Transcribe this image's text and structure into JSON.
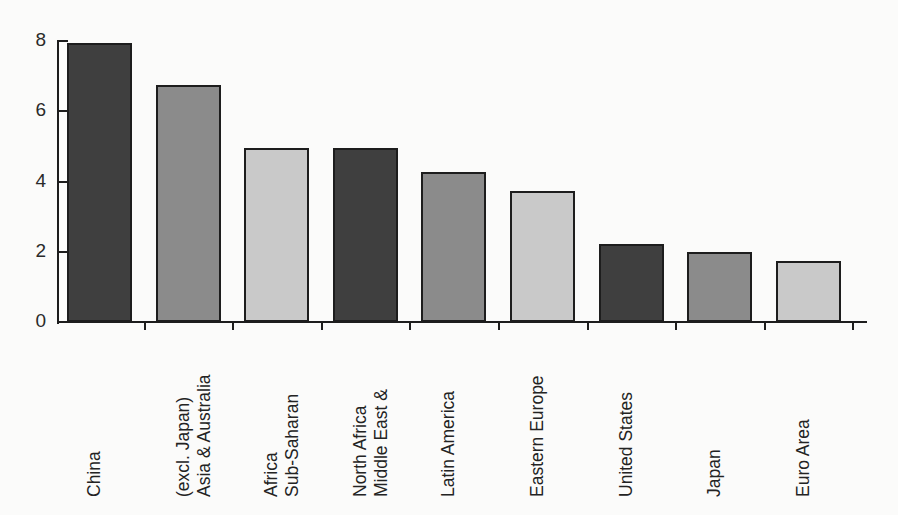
{
  "chart_data": {
    "type": "bar",
    "title": "",
    "subtitle": "",
    "xlabel": "",
    "ylabel": "",
    "ylim": [
      0,
      8
    ],
    "y_ticks": [
      0,
      2,
      4,
      6,
      8
    ],
    "y_tick_labels": [
      "0",
      "2",
      "4",
      "6",
      "8"
    ],
    "grid": false,
    "legend": false,
    "orientation": "vertical",
    "categories": [
      "China",
      "Asia & Australia\n(excl. Japan)",
      "Sub-Saharan\nAfrica",
      "Middle East &\nNorth Africa",
      "Latin America",
      "Eastern Europe",
      "United States",
      "Japan",
      "Euro Area"
    ],
    "bars": [
      {
        "label": "China",
        "label_lines": [
          "China"
        ],
        "value": 7.95,
        "fill": "#3f3f3f"
      },
      {
        "label": "Asia & Australia (excl. Japan)",
        "label_lines": [
          "(excl. Japan)",
          "Asia & Australia"
        ],
        "value": 6.75,
        "fill": "#8b8b8b"
      },
      {
        "label": "Sub-Saharan Africa",
        "label_lines": [
          "Africa",
          "Sub-Saharan"
        ],
        "value": 4.97,
        "fill": "#c9c9c9"
      },
      {
        "label": "Middle East & North Africa",
        "label_lines": [
          "North Africa",
          "Middle East &"
        ],
        "value": 4.97,
        "fill": "#3f3f3f"
      },
      {
        "label": "Latin America",
        "label_lines": [
          "Latin America"
        ],
        "value": 4.26,
        "fill": "#8b8b8b"
      },
      {
        "label": "Eastern Europe",
        "label_lines": [
          "Eastern Europe"
        ],
        "value": 3.74,
        "fill": "#c9c9c9"
      },
      {
        "label": "United States",
        "label_lines": [
          "United States"
        ],
        "value": 2.23,
        "fill": "#3f3f3f"
      },
      {
        "label": "Japan",
        "label_lines": [
          "Japan"
        ],
        "value": 2.0,
        "fill": "#8b8b8b"
      },
      {
        "label": "Euro Area",
        "label_lines": [
          "Euro Area"
        ],
        "value": 1.74,
        "fill": "#c9c9c9"
      }
    ],
    "colors": {
      "dark_bar": "#3f3f3f",
      "medium_bar": "#8b8b8b",
      "light_bar": "#c9c9c9",
      "axis": "#1d1d1d",
      "background": "#fbfbfa",
      "text": "#232323"
    }
  }
}
